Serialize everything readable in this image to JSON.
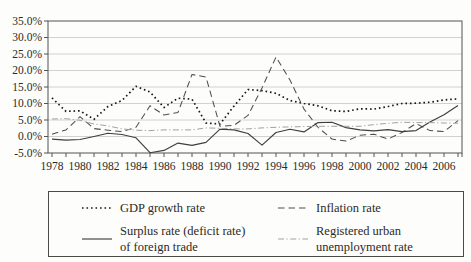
{
  "colors": {
    "gdp_line": "#161616",
    "inflation_line": "#4e4e4e",
    "trade_line": "#403f3c",
    "unemployment_line": "#a2a29e",
    "grid": "#c6c6c2",
    "axis": "#55534e",
    "text": "#2b2a26"
  },
  "chart_data": {
    "type": "line",
    "x": [
      1978,
      1979,
      1980,
      1981,
      1982,
      1983,
      1984,
      1985,
      1986,
      1987,
      1988,
      1989,
      1990,
      1991,
      1992,
      1993,
      1994,
      1995,
      1996,
      1997,
      1998,
      1999,
      2000,
      2001,
      2002,
      2003,
      2004,
      2005,
      2006,
      2007
    ],
    "x_label_years": [
      1978,
      1980,
      1982,
      1984,
      1986,
      1988,
      1990,
      1992,
      1994,
      1996,
      1998,
      2000,
      2002,
      2004,
      2006
    ],
    "ylim": [
      -5,
      35
    ],
    "y_tick_step": 5,
    "y_tick_labels": [
      "35.0%",
      "30.0%",
      "25.0%",
      "20.0%",
      "15.0%",
      "10.0%",
      "5.0%",
      "0.0%",
      "-5.0%"
    ],
    "grid": "horizontal",
    "legend_position": "bottom-box",
    "series": [
      {
        "name": "GDP growth rate",
        "style": "dotted",
        "values": [
          11.7,
          7.6,
          7.8,
          5.2,
          9.1,
          10.9,
          15.2,
          13.5,
          8.8,
          11.6,
          11.3,
          4.1,
          3.8,
          9.2,
          14.2,
          13.9,
          13.1,
          10.9,
          10.0,
          9.3,
          7.8,
          7.6,
          8.4,
          8.3,
          9.1,
          10.0,
          10.1,
          10.4,
          11.1,
          11.4
        ]
      },
      {
        "name": "Inflation rate",
        "style": "dashed",
        "values": [
          0.7,
          2.0,
          6.0,
          2.4,
          1.9,
          1.5,
          2.8,
          9.3,
          6.5,
          7.3,
          18.8,
          18.0,
          3.1,
          3.4,
          6.4,
          14.7,
          24.1,
          17.1,
          8.3,
          2.8,
          -0.8,
          -1.4,
          0.4,
          0.7,
          -0.8,
          1.2,
          3.9,
          1.8,
          1.5,
          4.8
        ]
      },
      {
        "name": "Surplus rate (deficit rate) of foreign trade",
        "style": "solid",
        "values": [
          -0.8,
          -1.1,
          -0.9,
          0.0,
          1.0,
          0.6,
          -0.4,
          -4.9,
          -4.2,
          -2.0,
          -2.7,
          -1.8,
          2.2,
          2.0,
          0.9,
          -2.6,
          1.2,
          2.2,
          1.4,
          4.2,
          4.3,
          2.7,
          2.0,
          1.7,
          2.1,
          1.5,
          1.8,
          4.4,
          6.6,
          9.4
        ]
      },
      {
        "name": "Registered urban unemployment rate",
        "style": "dashdot",
        "values": [
          5.3,
          5.4,
          4.9,
          3.8,
          3.2,
          2.3,
          1.9,
          1.8,
          2.0,
          2.0,
          2.0,
          2.6,
          2.5,
          2.3,
          2.3,
          2.6,
          2.8,
          2.9,
          3.0,
          3.1,
          3.1,
          3.1,
          3.1,
          3.6,
          4.0,
          4.3,
          4.2,
          4.2,
          4.1,
          4.0
        ]
      }
    ]
  },
  "legend": {
    "items": [
      {
        "line1": "GDP growth rate",
        "line2": "",
        "style": "dotted"
      },
      {
        "line1": "Inflation rate",
        "line2": "",
        "style": "dashed"
      },
      {
        "line1": "Surplus rate (deficit rate)",
        "line2": "of foreign trade",
        "style": "solid"
      },
      {
        "line1": "Registered urban",
        "line2": "unemployment rate",
        "style": "dashdot"
      }
    ]
  }
}
